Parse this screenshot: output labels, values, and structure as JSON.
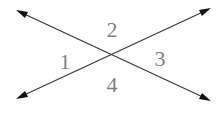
{
  "diagram": {
    "type": "intersecting-lines-angles",
    "line_color": "#3a3a3a",
    "label_color": "#7f7f7f",
    "lines": [
      {
        "name": "line-a",
        "from": [
          16,
          10
        ],
        "to": [
          211,
          101
        ]
      },
      {
        "name": "line-b",
        "from": [
          16,
          99
        ],
        "to": [
          211,
          8
        ]
      }
    ],
    "intersection": [
      112,
      56
    ],
    "angle_labels": [
      {
        "id": "1",
        "text": "1",
        "x": 65,
        "y": 69
      },
      {
        "id": "2",
        "text": "2",
        "x": 112,
        "y": 37
      },
      {
        "id": "3",
        "text": "3",
        "x": 160,
        "y": 66
      },
      {
        "id": "4",
        "text": "4",
        "x": 112,
        "y": 92
      }
    ]
  }
}
